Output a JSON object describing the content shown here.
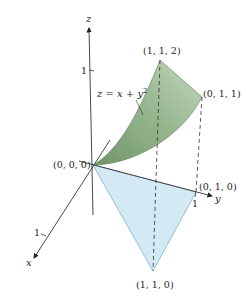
{
  "figure": {
    "axes": {
      "x": {
        "label": "x",
        "tick": "1"
      },
      "y": {
        "label": "y",
        "tick": "1"
      },
      "z": {
        "label": "z",
        "tick": "1"
      }
    },
    "points": {
      "origin": "(0, 0, 0)",
      "p112": "(1, 1, 2)",
      "p011": "(0, 1, 1)",
      "p010": "(0, 1, 0)",
      "p110": "(1, 1, 0)"
    },
    "surface_equation": {
      "lhs": "z",
      "eq": " = ",
      "x": "x",
      "plus": " + ",
      "y": "y",
      "exp": "2"
    },
    "colors": {
      "surface": "#8fae8a",
      "surface_light": "#c8d9c2",
      "region": "#cfe6f2",
      "region_edge": "#7fb3cf",
      "axis": "#333333"
    }
  }
}
